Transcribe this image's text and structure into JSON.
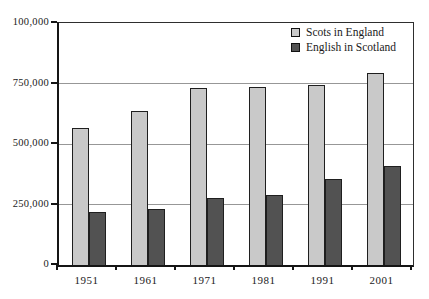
{
  "chart_data": {
    "type": "bar",
    "title": "",
    "xlabel": "",
    "ylabel": "",
    "categories": [
      "1951",
      "1961",
      "1971",
      "1981",
      "1991",
      "2001"
    ],
    "series": [
      {
        "name": "Scots in England",
        "color": "#c9c9c9",
        "values": [
          565000,
          635000,
          730000,
          735000,
          745000,
          795000
        ]
      },
      {
        "name": "English in Scotland",
        "color": "#525252",
        "values": [
          220000,
          230000,
          275000,
          290000,
          355000,
          410000
        ]
      }
    ],
    "y_axis": {
      "min": 0,
      "max": 1000000,
      "ticks": [
        {
          "value": 0,
          "label": "0"
        },
        {
          "value": 250000,
          "label": "250,000"
        },
        {
          "value": 500000,
          "label": "500,000"
        },
        {
          "value": 750000,
          "label": "750,000"
        },
        {
          "value": 1000000,
          "label": "100,000"
        }
      ]
    },
    "grid": "horizontal",
    "legend_position": "top-right",
    "colors": {
      "background": "#ffffff",
      "axis": "#151515",
      "gridline": "#979797",
      "bar_border": "#1f1f1f",
      "text": "#1a1a1a"
    }
  }
}
